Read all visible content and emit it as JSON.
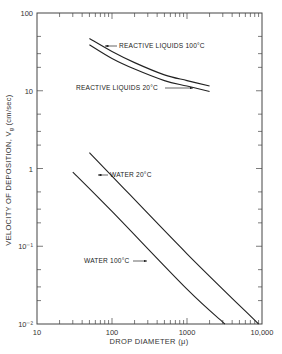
{
  "chart_data": {
    "type": "line",
    "title": "",
    "xlabel": "DROP DIAMETER (μ)",
    "ylabel": "VELOCITY OF DEPOSITION, Vg (cm/sec)",
    "xscale": "log",
    "yscale": "log",
    "xlim": [
      10,
      10000
    ],
    "ylim": [
      0.01,
      100
    ],
    "grid": false,
    "legend": "inline annotations with arrows",
    "x_ticks": [
      {
        "value": 10,
        "label": "10"
      },
      {
        "value": 100,
        "label": "100"
      },
      {
        "value": 1000,
        "label": "1000"
      },
      {
        "value": 10000,
        "label": "10,000"
      }
    ],
    "y_ticks": [
      {
        "value": 100,
        "label": "100"
      },
      {
        "value": 10,
        "label": "10"
      },
      {
        "value": 1,
        "label": "1"
      },
      {
        "value": 0.1,
        "label": "10⁻¹"
      },
      {
        "value": 0.01,
        "label": "10⁻²"
      }
    ],
    "series": [
      {
        "name": "REACTIVE LIQUIDS 100°C",
        "x": [
          50,
          100,
          200,
          500,
          1000,
          2000
        ],
        "y": [
          47,
          32,
          23,
          16,
          13.5,
          11.5
        ]
      },
      {
        "name": "REACTIVE LIQUIDS 20°C",
        "x": [
          50,
          100,
          200,
          500,
          1000,
          2000
        ],
        "y": [
          39,
          26,
          19,
          13.5,
          11.5,
          9.8
        ]
      },
      {
        "name": "WATER 20°C",
        "x": [
          50,
          100,
          1000,
          9000
        ],
        "y": [
          1.6,
          0.8,
          0.08,
          0.01
        ]
      },
      {
        "name": "WATER 100°C",
        "x": [
          30,
          100,
          1000,
          3200
        ],
        "y": [
          0.9,
          0.28,
          0.028,
          0.01
        ]
      }
    ],
    "annotations": [
      {
        "text": "REACTIVE LIQUIDS 100°C",
        "target": "REACTIVE LIQUIDS 100°C"
      },
      {
        "text": "REACTIVE LIQUIDS 20°C",
        "target": "REACTIVE LIQUIDS 20°C"
      },
      {
        "text": "WATER 20°C",
        "target": "WATER 20°C"
      },
      {
        "text": "WATER 100°C",
        "target": "WATER 100°C"
      }
    ]
  },
  "style": {
    "line_color": "#222222",
    "axis_color": "#444444",
    "background": "#ffffff"
  }
}
